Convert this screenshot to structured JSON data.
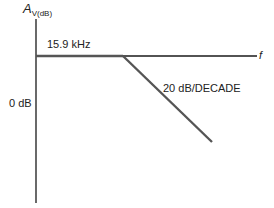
{
  "diagram": {
    "y_axis_label_main": "A",
    "y_axis_label_sub": "V(dB)",
    "x_axis_label": "f",
    "cutoff_label": "15.9 kHz",
    "zero_db_label": "0 dB",
    "slope_label": "20 dB/DECADE"
  },
  "colors": {
    "axis": "#1a1a1a",
    "response": "#555555",
    "background": "#ffffff"
  }
}
